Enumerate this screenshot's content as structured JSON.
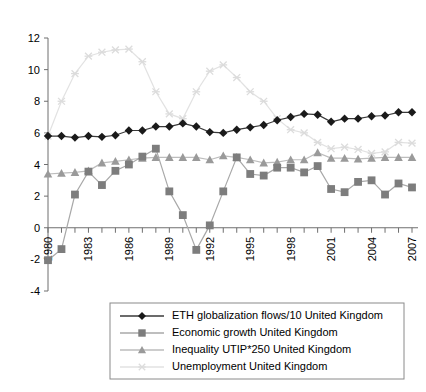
{
  "chart_data": {
    "type": "line",
    "title": "",
    "xlabel": "",
    "ylabel": "",
    "grid": false,
    "legend_position": "bottom",
    "xlim": [
      1980,
      2007
    ],
    "ylim": [
      -4,
      12
    ],
    "ytick_values": [
      -4,
      -2,
      0,
      2,
      4,
      6,
      8,
      10,
      12
    ],
    "ytick_labels": [
      "-4",
      "-2",
      "0",
      "2",
      "4",
      "6",
      "8",
      "10",
      "12"
    ],
    "x": [
      1980,
      1981,
      1982,
      1983,
      1984,
      1985,
      1986,
      1987,
      1988,
      1989,
      1990,
      1991,
      1992,
      1993,
      1994,
      1995,
      1996,
      1997,
      1998,
      1999,
      2000,
      2001,
      2002,
      2003,
      2004,
      2005,
      2006,
      2007
    ],
    "xtick_labels": [
      "1980",
      "1983",
      "1986",
      "1989",
      "1992",
      "1995",
      "1998",
      "2001",
      "2004",
      "2007"
    ],
    "xtick_label_values": [
      1980,
      1983,
      1986,
      1989,
      1992,
      1995,
      1998,
      2001,
      2004,
      2007
    ],
    "series": [
      {
        "name": "ETH globalization flows/10 United Kingdom",
        "marker": "diamond",
        "color": "#1a1a1a",
        "line_color": "#3a3a3a",
        "values": [
          5.8,
          5.8,
          5.7,
          5.8,
          5.75,
          5.85,
          6.15,
          6.15,
          6.4,
          6.4,
          6.6,
          6.4,
          6.05,
          6.0,
          6.2,
          6.35,
          6.5,
          6.8,
          7.0,
          7.2,
          7.15,
          6.7,
          6.9,
          6.9,
          7.05,
          7.1,
          7.3,
          7.3
        ]
      },
      {
        "name": "Economic growth United Kingdom",
        "marker": "square",
        "color": "#7d7d7d",
        "line_color": "#a8a8a8",
        "values": [
          -2.05,
          -1.35,
          2.1,
          3.55,
          2.7,
          3.6,
          4.0,
          4.5,
          5.0,
          2.3,
          0.8,
          -1.4,
          0.15,
          2.3,
          4.45,
          3.4,
          3.3,
          3.8,
          3.8,
          3.5,
          3.9,
          2.45,
          2.25,
          2.9,
          3.0,
          2.1,
          2.8,
          2.55
        ]
      },
      {
        "name": "Inequality UTIP*250 United Kingdom",
        "marker": "triangle",
        "color": "#9a9a9a",
        "line_color": "#bdbdbd",
        "values": [
          3.4,
          3.45,
          3.5,
          3.6,
          4.1,
          4.2,
          4.3,
          4.4,
          4.45,
          4.45,
          4.45,
          4.45,
          4.3,
          4.55,
          4.45,
          4.3,
          4.1,
          4.15,
          4.3,
          4.3,
          4.75,
          4.4,
          4.4,
          4.35,
          4.4,
          4.45,
          4.45,
          4.45
        ]
      },
      {
        "name": "Unemployment United Kingdom",
        "marker": "star",
        "color": "#dcdcdc",
        "line_color": "#e2e2e2",
        "values": [
          5.8,
          8.0,
          9.75,
          10.85,
          11.1,
          11.25,
          11.3,
          10.5,
          8.6,
          7.2,
          6.9,
          8.6,
          9.9,
          10.3,
          9.5,
          8.6,
          8.0,
          6.9,
          6.2,
          6.0,
          5.4,
          5.0,
          5.1,
          4.95,
          4.7,
          4.8,
          5.4,
          5.35
        ]
      }
    ]
  },
  "legend": {
    "items": [
      {
        "label": "ETH globalization flows/10 United Kingdom"
      },
      {
        "label": "Economic growth United Kingdom"
      },
      {
        "label": "Inequality UTIP*250 United Kingdom"
      },
      {
        "label": "Unemployment United Kingdom"
      }
    ]
  }
}
